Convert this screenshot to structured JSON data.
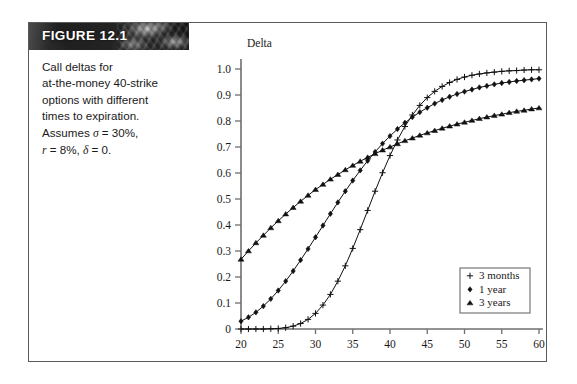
{
  "figure": {
    "banner_label": "FIGURE 12.1",
    "caption_lines": [
      "Call deltas for",
      "at-the-money 40-strike",
      "options with different",
      "times to expiration.",
      "Assumes σ = 30%,",
      "r = 8%,  δ = 0."
    ],
    "caption_plain": "Call deltas for at-the-money 40-strike options with different times to expiration. Assumes σ = 30%, r = 8%, δ = 0.",
    "border_color": "#5a5a5a",
    "banner_bg": "#1f1f1f",
    "banner_text_color": "#ffffff"
  },
  "chart_data": {
    "type": "line",
    "title": "",
    "xlabel": "Stock Price ($)",
    "ylabel": "Delta",
    "xlim": [
      20,
      60
    ],
    "ylim": [
      0,
      1.0
    ],
    "xticks": [
      20,
      25,
      30,
      35,
      40,
      45,
      50,
      55,
      60
    ],
    "xtick_labels": [
      "20",
      "25",
      "30",
      "35",
      "40",
      "45",
      "50",
      "55",
      "60"
    ],
    "yticks": [
      0,
      0.1,
      0.2,
      0.3,
      0.4,
      0.5,
      0.6,
      0.7,
      0.8,
      0.9,
      1.0
    ],
    "ytick_labels": [
      "0",
      "0.1",
      "0.2",
      "0.3",
      "0.4",
      "0.5",
      "0.6",
      "0.7",
      "0.8",
      "0.9",
      "1.0"
    ],
    "grid": false,
    "legend_position": "lower right",
    "line_color": "#111111",
    "x": [
      20,
      21,
      22,
      23,
      24,
      25,
      26,
      27,
      28,
      29,
      30,
      31,
      32,
      33,
      34,
      35,
      36,
      37,
      38,
      39,
      40,
      41,
      42,
      43,
      44,
      45,
      46,
      47,
      48,
      49,
      50,
      51,
      52,
      53,
      54,
      55,
      56,
      57,
      58,
      59,
      60
    ],
    "series": [
      {
        "name": "3 months",
        "marker": "plus",
        "values": [
          0.0,
          0.0,
          0.0,
          0.0,
          0.001,
          0.002,
          0.005,
          0.011,
          0.021,
          0.037,
          0.06,
          0.092,
          0.133,
          0.184,
          0.243,
          0.31,
          0.382,
          0.456,
          0.53,
          0.601,
          0.667,
          0.727,
          0.779,
          0.823,
          0.86,
          0.89,
          0.914,
          0.933,
          0.948,
          0.96,
          0.969,
          0.976,
          0.981,
          0.985,
          0.988,
          0.991,
          0.993,
          0.994,
          0.996,
          0.997,
          0.997
        ]
      },
      {
        "name": "1 year",
        "marker": "diamond",
        "values": [
          0.03,
          0.045,
          0.064,
          0.088,
          0.116,
          0.148,
          0.184,
          0.223,
          0.265,
          0.308,
          0.353,
          0.398,
          0.443,
          0.487,
          0.53,
          0.571,
          0.61,
          0.647,
          0.681,
          0.713,
          0.742,
          0.769,
          0.793,
          0.815,
          0.834,
          0.851,
          0.867,
          0.881,
          0.893,
          0.904,
          0.913,
          0.921,
          0.929,
          0.935,
          0.941,
          0.946,
          0.95,
          0.954,
          0.957,
          0.96,
          0.963
        ]
      },
      {
        "name": "3 years",
        "marker": "triangle",
        "values": [
          0.268,
          0.3,
          0.331,
          0.36,
          0.389,
          0.416,
          0.442,
          0.467,
          0.491,
          0.514,
          0.536,
          0.556,
          0.576,
          0.594,
          0.612,
          0.629,
          0.645,
          0.66,
          0.674,
          0.688,
          0.7,
          0.712,
          0.724,
          0.734,
          0.745,
          0.754,
          0.763,
          0.772,
          0.78,
          0.788,
          0.795,
          0.802,
          0.809,
          0.815,
          0.821,
          0.826,
          0.832,
          0.837,
          0.841,
          0.846,
          0.85
        ]
      }
    ],
    "legend_entries": [
      {
        "label": "3 months",
        "marker": "plus"
      },
      {
        "label": "1 year",
        "marker": "diamond"
      },
      {
        "label": "3 years",
        "marker": "triangle"
      }
    ]
  }
}
